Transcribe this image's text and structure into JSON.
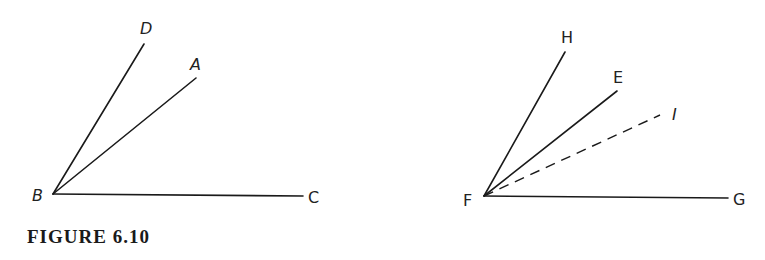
{
  "caption": "FIGURE 6.10",
  "figures": [
    {
      "name": "left-angle-figure",
      "vertex": {
        "label": "B",
        "x": 53,
        "y": 194
      },
      "rays": [
        {
          "label": "D",
          "end": [
            144,
            44
          ],
          "style": "solid"
        },
        {
          "label": "A",
          "end": [
            196,
            78
          ],
          "style": "solid"
        },
        {
          "label": "C",
          "end": [
            303,
            196
          ],
          "style": "solid"
        }
      ]
    },
    {
      "name": "right-angle-figure",
      "vertex": {
        "label": "F",
        "x": 484,
        "y": 196
      },
      "rays": [
        {
          "label": "H",
          "end": [
            565,
            52
          ],
          "style": "solid"
        },
        {
          "label": "E",
          "end": [
            617,
            91
          ],
          "style": "solid"
        },
        {
          "label": "I",
          "end": [
            660,
            115
          ],
          "style": "dashed"
        },
        {
          "label": "G",
          "end": [
            728,
            198
          ],
          "style": "solid"
        }
      ]
    }
  ],
  "labels": {
    "B": "B",
    "D": "D",
    "A": "A",
    "C": "C",
    "F": "F",
    "H": "H",
    "E": "E",
    "I": "I",
    "G": "G"
  }
}
